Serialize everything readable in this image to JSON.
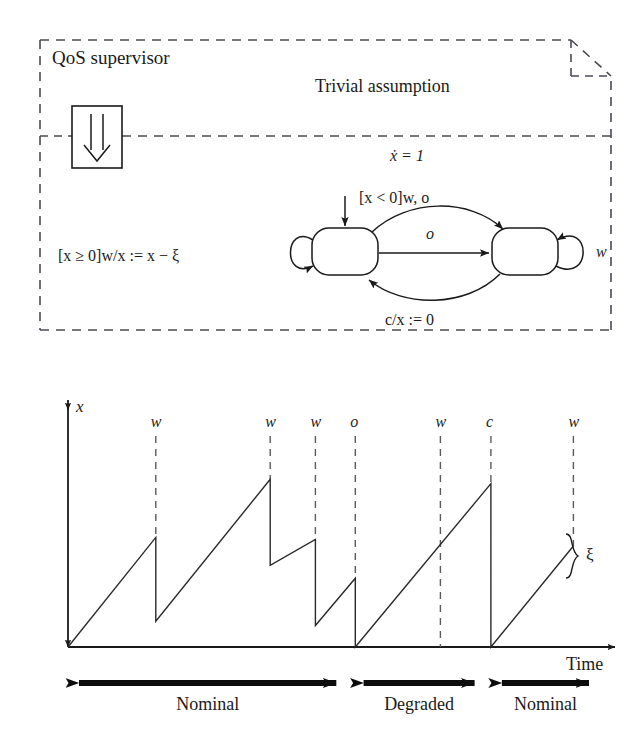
{
  "figure": {
    "supervisor_box": {
      "title": "QoS supervisor",
      "icon_name": "double-down-arrow-icon",
      "guard_label": "[x ≥ 0]w/x := x − ξ"
    },
    "note_box": {
      "title": "Trivial assumption",
      "flow_equation": "ẋ = 1",
      "corner_name": "folded-corner"
    },
    "automaton": {
      "states": [
        {
          "id": "nominal",
          "label": ""
        },
        {
          "id": "degraded",
          "label": ""
        }
      ],
      "transitions": [
        {
          "from": "nominal",
          "to": "degraded",
          "label": "[x < 0]w, o",
          "position": "top"
        },
        {
          "from": "nominal",
          "to": "degraded",
          "label": "o",
          "position": "middle"
        },
        {
          "from": "degraded",
          "to": "nominal",
          "label": "c/x := 0",
          "position": "bottom"
        },
        {
          "from": "degraded",
          "to": "degraded",
          "label": "w",
          "position": "self-right"
        },
        {
          "from": "nominal",
          "to": "nominal",
          "label": "",
          "position": "self-left"
        }
      ],
      "initial_marker": true
    }
  },
  "chart_data": {
    "type": "line",
    "title": "",
    "xlabel": "Time",
    "ylabel": "x",
    "grid": false,
    "legend": null,
    "xlim": [
      0,
      100
    ],
    "ylim": [
      0,
      100
    ],
    "annotations": [
      {
        "label": "ξ",
        "type": "brace",
        "at_event": 7,
        "meaning": "drop amount at w"
      }
    ],
    "events": [
      {
        "name": "w",
        "x": 16.5,
        "type": "decrement"
      },
      {
        "name": "w",
        "x": 38.0,
        "type": "decrement"
      },
      {
        "name": "w",
        "x": 46.5,
        "type": "decrement"
      },
      {
        "name": "o",
        "x": 54.0,
        "type": "reset"
      },
      {
        "name": "w",
        "x": 70.0,
        "type": "passthrough"
      },
      {
        "name": "c",
        "x": 79.5,
        "type": "reset"
      },
      {
        "name": "w",
        "x": 95.0,
        "type": "decrement"
      }
    ],
    "vertices": [
      {
        "x": 0.0,
        "y": 0
      },
      {
        "x": 16.5,
        "y": 51
      },
      {
        "x": 16.5,
        "y": 12
      },
      {
        "x": 38.0,
        "y": 78
      },
      {
        "x": 38.0,
        "y": 38
      },
      {
        "x": 46.5,
        "y": 50
      },
      {
        "x": 46.5,
        "y": 10
      },
      {
        "x": 54.0,
        "y": 32
      },
      {
        "x": 54.0,
        "y": 0
      },
      {
        "x": 79.5,
        "y": 76
      },
      {
        "x": 79.5,
        "y": 0
      },
      {
        "x": 95.0,
        "y": 47
      }
    ],
    "phases": [
      {
        "label": "Nominal",
        "x_start": 0.0,
        "x_end": 52.5
      },
      {
        "label": "Degraded",
        "x_start": 53.5,
        "x_end": 78.5
      },
      {
        "label": "Nominal",
        "x_start": 79.5,
        "x_end": 100.0
      }
    ]
  }
}
